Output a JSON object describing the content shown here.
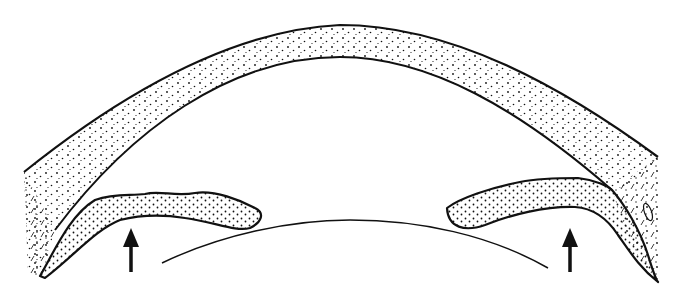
{
  "figure": {
    "description": "Line drawing of the anterior segment of the eye showing cornea, iris and lens, with two arrows pointing up at the iris",
    "background": "#ffffff",
    "ink": "#111111",
    "parts": {
      "cornea": "cornea",
      "iris_left": "iris-left",
      "iris_right": "iris-right",
      "lens": "lens-surface",
      "arrow_left": "arrow-up",
      "arrow_right": "arrow-up"
    }
  }
}
